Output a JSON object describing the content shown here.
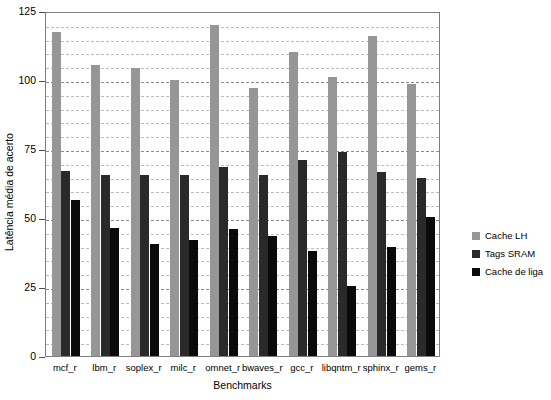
{
  "chart_data": {
    "type": "bar",
    "title": "",
    "xlabel": "Benchmarks",
    "ylabel": "Latência média de acerto",
    "ylim": [
      0,
      125
    ],
    "ytick_values": [
      0,
      25,
      50,
      75,
      100,
      125
    ],
    "ytick_labels": [
      "0",
      "25",
      "50",
      "75",
      "100",
      "125"
    ],
    "minor_gridline_step": 5,
    "grid": true,
    "legend_position": "right",
    "categories": [
      "mcf_r",
      "lbm_r",
      "soplex_r",
      "milc_r",
      "omnet_r",
      "bwaves_r",
      "gcc_r",
      "libqntm_r",
      "sphinx_r",
      "gems_r"
    ],
    "series": [
      {
        "name": "Cache LH",
        "color": "#969696",
        "values": [
          117.5,
          105.5,
          104.5,
          100,
          120,
          97,
          110,
          101,
          116,
          98.5
        ]
      },
      {
        "name": "Tags SRAM",
        "color": "#2a2a2a",
        "values": [
          67,
          65.5,
          65.5,
          65.5,
          68.5,
          65.5,
          71,
          74,
          66.5,
          64.5
        ]
      },
      {
        "name": "Cache de liga",
        "color": "#0a0a0a",
        "values": [
          56.5,
          46.5,
          40.5,
          42,
          46,
          43.5,
          38,
          25.5,
          39.5,
          50.5
        ]
      }
    ]
  },
  "legend": {
    "entries": [
      {
        "label": "Cache LH",
        "color": "#969696"
      },
      {
        "label": "Tags SRAM",
        "color": "#2a2a2a"
      },
      {
        "label": "Cache de liga",
        "color": "#0a0a0a"
      }
    ]
  }
}
